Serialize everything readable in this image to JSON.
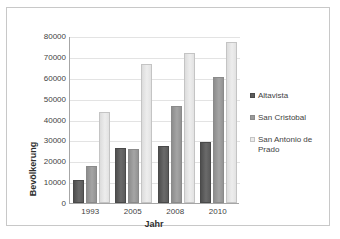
{
  "chart_data": {
    "type": "bar",
    "title": "",
    "xlabel": "Jahr",
    "ylabel": "Bevölkerung",
    "categories": [
      "1993",
      "2005",
      "2008",
      "2010"
    ],
    "series": [
      {
        "name": "Altavista",
        "color": "#5b5b5b",
        "values": [
          11000,
          26300,
          27100,
          29000
        ]
      },
      {
        "name": "San Cristobal",
        "color": "#9a9a9a",
        "values": [
          17500,
          26000,
          46500,
          60200
        ]
      },
      {
        "name": "San Antonio de Prado",
        "color": "#ececec",
        "values": [
          43500,
          66500,
          72000,
          77300
        ]
      }
    ],
    "ylim": [
      0,
      80000
    ],
    "yticks": [
      "0",
      "10000",
      "20000",
      "30000",
      "40000",
      "50000",
      "60000",
      "70000",
      "80000"
    ],
    "ytick_values": [
      0,
      10000,
      20000,
      30000,
      40000,
      50000,
      60000,
      70000,
      80000
    ],
    "grid": true,
    "legend_position": "right"
  }
}
